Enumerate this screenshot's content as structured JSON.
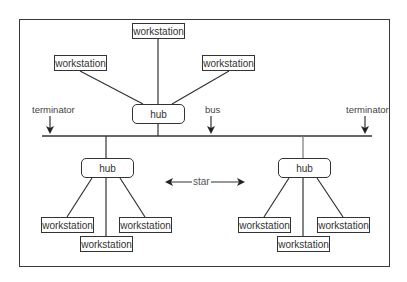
{
  "diagram": {
    "type": "hybrid star-bus network topology",
    "labels": {
      "terminator_left": "terminator",
      "terminator_right": "terminator",
      "bus": "bus",
      "star": "star"
    },
    "top_star": {
      "hub": "hub",
      "workstations": [
        "workstation",
        "workstation",
        "workstation"
      ]
    },
    "left_star": {
      "hub": "hub",
      "workstations": [
        "workstation",
        "workstation",
        "workstation"
      ]
    },
    "right_star": {
      "hub": "hub",
      "workstations": [
        "workstation",
        "workstation",
        "workstation"
      ]
    },
    "colors": {
      "line": "#333333",
      "background": "#ffffff"
    }
  }
}
